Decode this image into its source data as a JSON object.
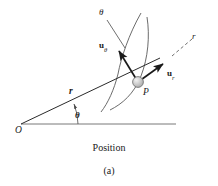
{
  "figure": {
    "caption": "Position",
    "subfigure_label": "(a)",
    "colors": {
      "stroke": "#1a1a1a",
      "thin_stroke": "#555555",
      "particle_fill": "#c9c9c9",
      "particle_stroke": "#6b6b6b",
      "background": "#ffffff"
    },
    "labels": {
      "theta_axis": "θ",
      "theta_angle": "θ",
      "r_axis": "r",
      "origin": "O",
      "point": "P",
      "r_vector": "r",
      "u_theta_base": "u",
      "u_theta_sub": "θ",
      "u_r_base": "u",
      "u_r_sub": "r"
    },
    "geometry": {
      "origin": [
        21,
        124
      ],
      "point_P": [
        138,
        82
      ],
      "particle_radius": 5.5,
      "baseline": {
        "x1": 21,
        "y1": 124,
        "x2": 176,
        "y2": 124
      },
      "r_axis_line": {
        "x1": 21,
        "y1": 124,
        "x2": 197,
        "y2": 41
      },
      "angle_arc_radius": 52,
      "angle_degrees": 20,
      "u_theta_arrow": {
        "x1": 138,
        "y1": 82,
        "x2": 118,
        "y2": 50
      },
      "u_r_arrow": {
        "x1": 138,
        "y1": 82,
        "x2": 164,
        "y2": 64
      },
      "theta_leader": {
        "x1": 106,
        "y1": 18,
        "x2": 124,
        "y2": 47
      },
      "trajectory": {
        "start": [
          141,
          13
        ],
        "control": [
          118,
          66
        ],
        "end": [
          101,
          112
        ]
      }
    }
  }
}
